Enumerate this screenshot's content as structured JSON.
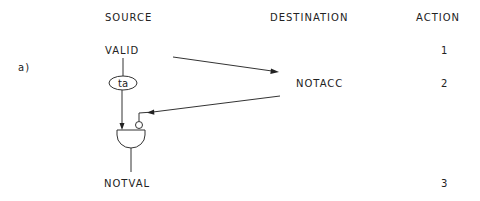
{
  "headers": {
    "source": "SOURCE",
    "destination": "DESTINATION",
    "action": "ACTION"
  },
  "label_a": "a)",
  "nodes": {
    "valid": "VALID",
    "ta": "ta",
    "notacc": "NOTACC",
    "notval": "NOTVAL"
  },
  "actions": [
    "1",
    "2",
    "3"
  ],
  "colors": {
    "ink": "#222222",
    "background": "#ffffff"
  }
}
